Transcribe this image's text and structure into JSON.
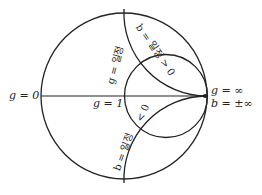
{
  "diagram": {
    "type": "smith-chart-admittance",
    "colors": {
      "stroke": "#222222",
      "background": "#ffffff"
    },
    "labels": {
      "g_zero": "g = 0",
      "g_one": "g = 1",
      "g_inf": "g = ∞",
      "b_inf": "b = ±∞",
      "g_const": "g = 일정",
      "b_pos": "b = 일정 > 0",
      "b_neg_prefix": "b = 일정",
      "b_neg_suffix": "< 0"
    }
  }
}
